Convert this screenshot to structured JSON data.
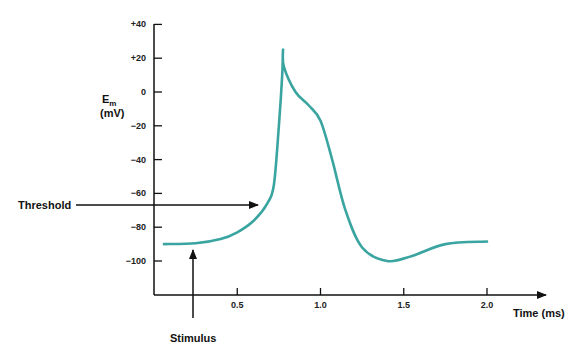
{
  "chart_data": {
    "type": "line",
    "title": "",
    "xlabel": "Time (ms)",
    "ylabel": "E_m (mV)",
    "ylabel_main": "E",
    "ylabel_sub": "m",
    "ylabel_units": "(mV)",
    "xlim": [
      0,
      2.25
    ],
    "ylim": [
      -120,
      40
    ],
    "grid": false,
    "x_ticks": [
      0.5,
      1.0,
      1.5,
      2.0
    ],
    "x_tick_labels": [
      "0.5",
      "1.0",
      "1.5",
      "2.0"
    ],
    "y_ticks": [
      40,
      20,
      0,
      -20,
      -40,
      -60,
      -80,
      -100
    ],
    "y_tick_labels": [
      "+40",
      "+20",
      "0",
      "−20",
      "−40",
      "−60",
      "−80",
      "−100"
    ],
    "series": [
      {
        "name": "Action potential",
        "color": "#3aa5a0",
        "x": [
          0.06,
          0.25,
          0.4,
          0.5,
          0.6,
          0.68,
          0.72,
          0.75,
          0.77,
          0.775,
          0.78,
          0.85,
          0.93,
          1.0,
          1.07,
          1.15,
          1.25,
          1.4,
          1.55,
          1.75,
          2.0
        ],
        "y": [
          -90,
          -89.5,
          -87,
          -83,
          -76,
          -66,
          -55,
          -20,
          10,
          25,
          15,
          0,
          -8,
          -17,
          -40,
          -70,
          -92,
          -100,
          -97,
          -90,
          -88.5
        ]
      }
    ],
    "annotations": [
      {
        "text": "Threshold",
        "type": "arrow-right",
        "y_value": -67,
        "arrow_to_x": 0.62
      },
      {
        "text": "Stimulus",
        "type": "arrow-up",
        "x_value": 0.23,
        "arrow_to_y": -92
      }
    ]
  }
}
